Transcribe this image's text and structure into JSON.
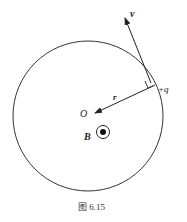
{
  "diagram": {
    "labels": {
      "velocity": "v",
      "charge": "+q",
      "radius": "r",
      "center": "O",
      "field": "B"
    },
    "caption": "图 6.15",
    "colors": {
      "stroke": "#333333",
      "background": "#ffffff"
    }
  }
}
